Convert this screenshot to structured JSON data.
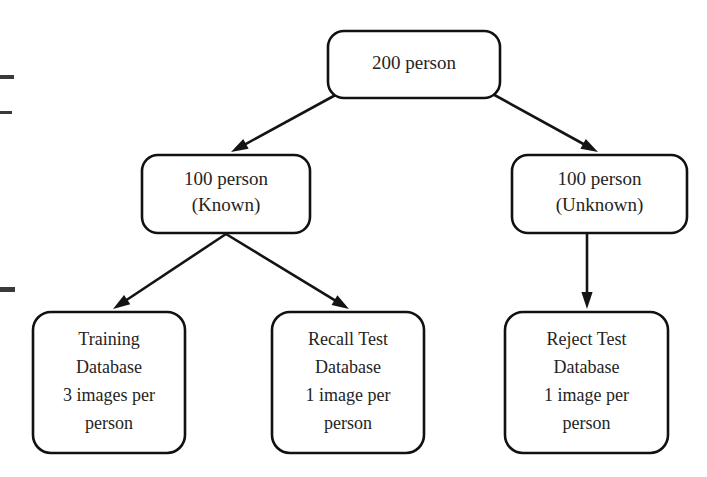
{
  "diagram": {
    "style": {
      "background_color": "#ffffff",
      "box_stroke_color": "#111111",
      "text_color": "#242424",
      "arrow_color": "#141414"
    },
    "nodes": [
      {
        "id": "root",
        "name": "total-person-node",
        "lines": [
          "200 person"
        ],
        "x": 328,
        "y": 31,
        "w": 172,
        "h": 67,
        "r": 16
      },
      {
        "id": "known",
        "name": "known-person-node",
        "lines": [
          "100 person",
          "(Known)"
        ],
        "x": 142,
        "y": 155,
        "w": 168,
        "h": 78,
        "r": 16
      },
      {
        "id": "unknown",
        "name": "unknown-person-node",
        "lines": [
          "100 person",
          "(Unknown)"
        ],
        "x": 512,
        "y": 155,
        "w": 175,
        "h": 78,
        "r": 16
      },
      {
        "id": "training",
        "name": "training-database-node",
        "lines": [
          "Training",
          "Database",
          "3 images per",
          "person"
        ],
        "x": 33,
        "y": 312,
        "w": 152,
        "h": 141,
        "r": 18
      },
      {
        "id": "recall",
        "name": "recall-test-database-node",
        "lines": [
          "Recall Test",
          "Database",
          "1 image per",
          "person"
        ],
        "x": 272,
        "y": 312,
        "w": 152,
        "h": 141,
        "r": 18
      },
      {
        "id": "reject",
        "name": "reject-test-database-node",
        "lines": [
          "Reject Test",
          "Database",
          "1 image per",
          "person"
        ],
        "x": 505,
        "y": 312,
        "w": 163,
        "h": 141,
        "r": 18
      }
    ],
    "edges": [
      {
        "id": "root-known",
        "name": "edge-root-to-known",
        "from": "root",
        "to": "known",
        "x1": 341,
        "y1": 92,
        "x2": 231,
        "y2": 152
      },
      {
        "id": "root-unknown",
        "name": "edge-root-to-unknown",
        "from": "root",
        "to": "unknown",
        "x1": 489,
        "y1": 92,
        "x2": 598,
        "y2": 152
      },
      {
        "id": "known-training",
        "name": "edge-known-to-training",
        "from": "known",
        "to": "training",
        "x1": 226,
        "y1": 234,
        "x2": 113,
        "y2": 309
      },
      {
        "id": "known-recall",
        "name": "edge-known-to-recall",
        "from": "known",
        "to": "recall",
        "x1": 226,
        "y1": 234,
        "x2": 349,
        "y2": 309
      },
      {
        "id": "unknown-reject",
        "name": "edge-unknown-to-reject",
        "from": "unknown",
        "to": "reject",
        "x1": 587,
        "y1": 234,
        "x2": 587,
        "y2": 309
      }
    ],
    "scan_marks": [
      {
        "name": "scan-artifact-mark-1",
        "x": 0,
        "y": 75,
        "w": 14,
        "h": 4
      },
      {
        "name": "scan-artifact-mark-2",
        "x": 0,
        "y": 111,
        "w": 12,
        "h": 3
      },
      {
        "name": "scan-artifact-mark-3",
        "x": 0,
        "y": 287,
        "w": 15,
        "h": 5
      }
    ]
  }
}
